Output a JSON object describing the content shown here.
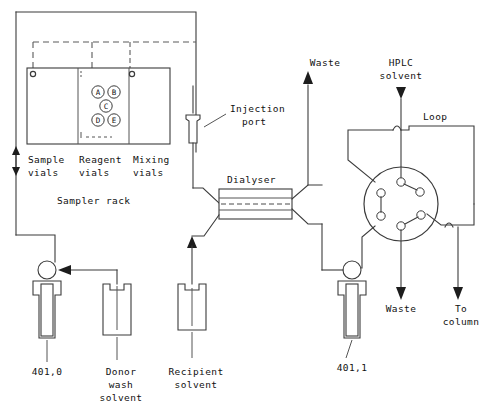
{
  "diagram": {
    "sampler": {
      "rack_label": "Sampler rack",
      "column_labels": [
        {
          "line1": "Sample",
          "line2": "vials"
        },
        {
          "line1": "Reagent",
          "line2": "vials"
        },
        {
          "line1": "Mixing",
          "line2": "vials"
        }
      ],
      "reagent_vials": [
        "A",
        "B",
        "C",
        "D",
        "E"
      ]
    },
    "components": {
      "injection_port": "Injection\nport",
      "injection_port_line1": "Injection",
      "injection_port_line2": "port",
      "dialyser": "Dialyser",
      "loop": "Loop",
      "hplc_solvent_line1": "HPLC",
      "hplc_solvent_line2": "solvent"
    },
    "streams": {
      "waste_top": "Waste",
      "waste_bottom": "Waste",
      "to_column_line1": "To",
      "to_column_line2": "column"
    },
    "pumps": [
      {
        "id": "401,0"
      },
      {
        "id": "401,1"
      }
    ],
    "reservoirs": [
      {
        "line1": "Donor",
        "line2": "wash",
        "line3": "solvent"
      },
      {
        "line1": "Recipient",
        "line2": "solvent",
        "line3": ""
      }
    ],
    "colors": {
      "line": "#3b3b3b",
      "arrow": "#1d1d1d",
      "text": "#111111",
      "background": "#ffffff"
    }
  }
}
